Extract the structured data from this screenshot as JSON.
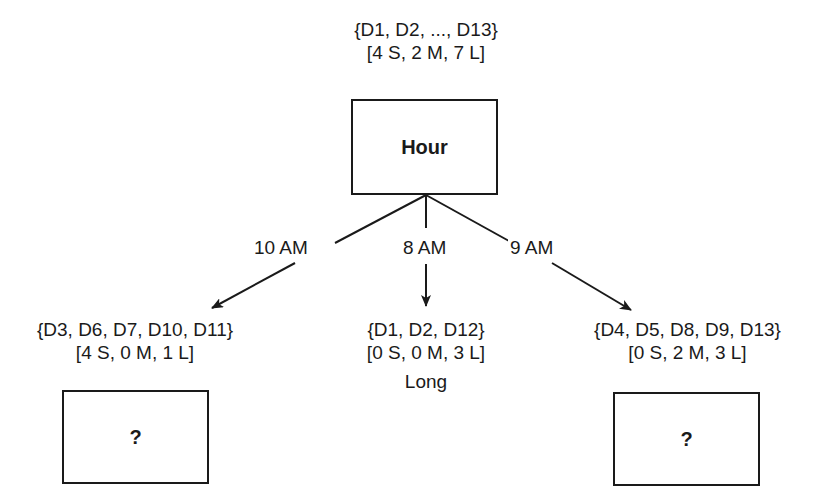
{
  "root": {
    "set": "{D1, D2, ..., D13}",
    "counts": "[4 S, 2 M, 7 L]",
    "attribute": "Hour"
  },
  "branches": [
    {
      "edge_label": "10 AM",
      "set": "{D3, D6, D7, D10, D11}",
      "counts": "[4 S, 0 M, 1 L]",
      "node": "?"
    },
    {
      "edge_label": "8 AM",
      "set": "{D1, D2, D12}",
      "counts": "[0 S, 0 M, 3 L]",
      "leaf": "Long"
    },
    {
      "edge_label": "9 AM",
      "set": "{D4, D5, D8, D9, D13}",
      "counts": "[0 S, 2 M, 3 L]",
      "node": "?"
    }
  ]
}
